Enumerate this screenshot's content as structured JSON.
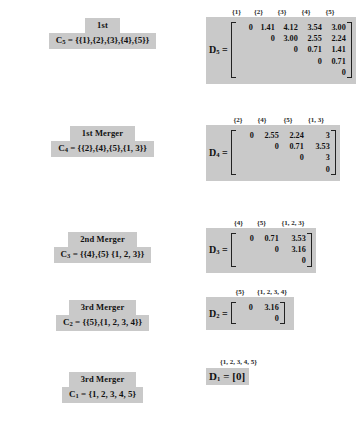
{
  "figure": {
    "type": "hierarchical-clustering-steps",
    "stages": [
      {
        "id": "stage-5",
        "title": "1st",
        "cluster_equation": "C5 = {{1},{2},{3},{4},{5}}",
        "cluster_symbol": "C",
        "cluster_subscript": "5",
        "cluster_value": "{{1},{2},{3},{4},{5}}",
        "matrix_label": "D",
        "matrix_subscript": "5",
        "matrix_headers": [
          "{1}",
          "{2}",
          "{3}",
          "{4}",
          "{5}"
        ],
        "matrix_rows": [
          [
            "0",
            "1.41",
            "4.12",
            "3.54",
            "3.00"
          ],
          [
            "",
            "0",
            "3.00",
            "2.55",
            "2.24"
          ],
          [
            "",
            "",
            "0",
            "0.71",
            "1.41"
          ],
          [
            "",
            "",
            "",
            "0",
            "0.71"
          ],
          [
            "",
            "",
            "",
            "",
            "0"
          ]
        ]
      },
      {
        "id": "stage-4",
        "title": "1st Merger",
        "cluster_equation": "C4 = {{2},{4},{5},{1, 3}}",
        "cluster_symbol": "C",
        "cluster_subscript": "4",
        "cluster_value": "{{2},{4},{5},{1, 3}}",
        "matrix_label": "D",
        "matrix_subscript": "4",
        "matrix_headers": [
          "{2}",
          "{4}",
          "{5}",
          "{1, 3}"
        ],
        "matrix_rows": [
          [
            "0",
            "2.55",
            "2.24",
            "3"
          ],
          [
            "",
            "0",
            "0.71",
            "3.53"
          ],
          [
            "",
            "",
            "0",
            "3"
          ],
          [
            "",
            "",
            "",
            "0"
          ]
        ]
      },
      {
        "id": "stage-3",
        "title": "2nd Merger",
        "cluster_equation": "C3 = {{4},{5} {1, 2, 3}}",
        "cluster_symbol": "C",
        "cluster_subscript": "3",
        "cluster_value": "{{4},{5} {1, 2, 3}}",
        "matrix_label": "D",
        "matrix_subscript": "3",
        "matrix_headers": [
          "{4}",
          "{5}",
          "{1, 2, 3}"
        ],
        "matrix_rows": [
          [
            "0",
            "0.71",
            "3.53"
          ],
          [
            "",
            "0",
            "3.16"
          ],
          [
            "",
            "",
            "0"
          ]
        ]
      },
      {
        "id": "stage-2",
        "title": "3rd Merger",
        "cluster_equation": "C2 = {{5},{1, 2, 3, 4}}",
        "cluster_symbol": "C",
        "cluster_subscript": "2",
        "cluster_value": "{{5},{1, 2, 3, 4}}",
        "matrix_label": "D",
        "matrix_subscript": "2",
        "matrix_headers": [
          "{5}",
          "{1, 2, 3, 4}"
        ],
        "matrix_rows": [
          [
            "0",
            "3.16"
          ],
          [
            "",
            "0"
          ]
        ]
      },
      {
        "id": "stage-1",
        "title": "3rd Merger",
        "cluster_equation": "C1 = {1, 2, 3, 4, 5}",
        "cluster_symbol": "C",
        "cluster_subscript": "1",
        "cluster_value": "{1, 2, 3, 4, 5}",
        "matrix_label": "D",
        "matrix_subscript": "1",
        "matrix_headers": [
          "{1, 2, 3, 4, 5}"
        ],
        "matrix_rows": [
          [
            "0"
          ]
        ],
        "matrix_inline": "= [0]"
      }
    ],
    "colors": {
      "highlight_background": "#c9c9c9",
      "text": "#111111",
      "page_background": "#ffffff"
    }
  }
}
